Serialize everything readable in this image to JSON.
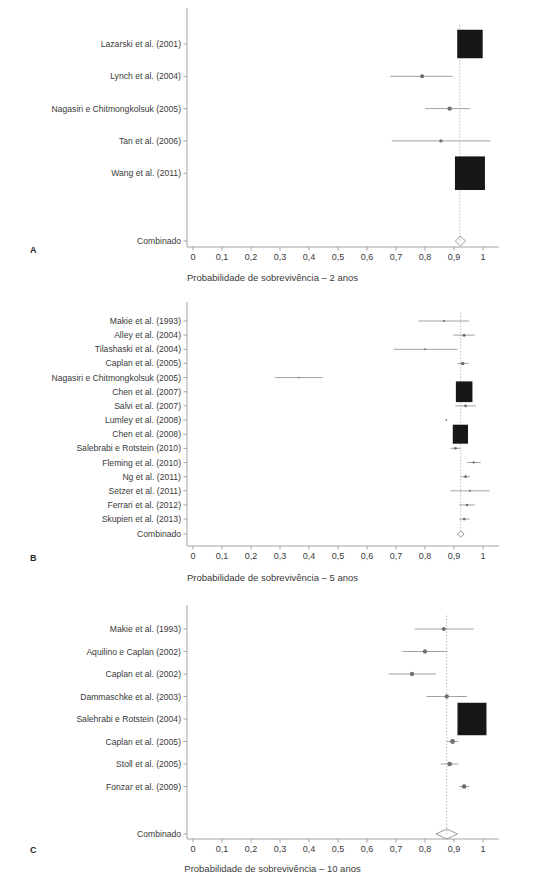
{
  "figure": {
    "panel_letters": [
      "A",
      "B",
      "C"
    ],
    "combined_label": "Combinado",
    "axis_tick_labels": [
      "0",
      "0,1",
      "0,2",
      "0,3",
      "0,4",
      "0,5",
      "0,6",
      "0,7",
      "0,8",
      "0,9",
      "1"
    ],
    "axis_tick_values": [
      0,
      0.1,
      0.2,
      0.3,
      0.4,
      0.5,
      0.6,
      0.7,
      0.8,
      0.9,
      1
    ],
    "colors": {
      "box": "#171717",
      "ci_line": "#8c8c8c",
      "axis": "#9a9a9a",
      "reference_line": "#b0b0b0",
      "text": "#3a3a3a"
    }
  },
  "bottom_caption": "",
  "chart_data": [
    {
      "type": "forest",
      "panel": "A",
      "title": "",
      "xlabel": "Probabilidade de sobrevivência – 2 anos",
      "ylabel": "",
      "xlim": [
        0,
        1.05
      ],
      "grid": false,
      "reference_line": 0.92,
      "studies": [
        {
          "label": "Lazarski et al. (2001)",
          "estimate": 0.955,
          "ci_low": 0.937,
          "ci_high": 0.973,
          "weight": 0.72
        },
        {
          "label": "Lynch et al. (2004)",
          "estimate": 0.79,
          "ci_low": 0.68,
          "ci_high": 0.895,
          "weight": 0.06
        },
        {
          "label": "Nagasiri e Chitmongkolsuk (2005)",
          "estimate": 0.885,
          "ci_low": 0.8,
          "ci_high": 0.955,
          "weight": 0.07
        },
        {
          "label": "Tan et al. (2006)",
          "estimate": 0.855,
          "ci_low": 0.685,
          "ci_high": 1.025,
          "weight": 0.04
        },
        {
          "label": "Wang et al. (2011)",
          "estimate": 0.955,
          "ci_low": 0.925,
          "ci_high": 0.99,
          "weight": 1.0
        }
      ],
      "combined": {
        "label": "Combinado",
        "estimate": 0.922,
        "ci_low": 0.905,
        "ci_high": 0.94
      }
    },
    {
      "type": "forest",
      "panel": "B",
      "title": "",
      "xlabel": "Probabilidade de sobrevivência – 5 anos",
      "ylabel": "",
      "xlim": [
        0,
        1.05
      ],
      "grid": false,
      "reference_line": 0.923,
      "studies": [
        {
          "label": "Makie et al. (1993)",
          "estimate": 0.865,
          "ci_low": 0.777,
          "ci_high": 0.952,
          "weight": 0.05
        },
        {
          "label": "Alley et al. (2004)",
          "estimate": 0.935,
          "ci_low": 0.897,
          "ci_high": 0.972,
          "weight": 0.1
        },
        {
          "label": "Tilashaski et al. (2004)",
          "estimate": 0.8,
          "ci_low": 0.692,
          "ci_high": 0.912,
          "weight": 0.04
        },
        {
          "label": "Caplan et al. (2005)",
          "estimate": 0.93,
          "ci_low": 0.912,
          "ci_high": 0.95,
          "weight": 0.14
        },
        {
          "label": "Nagasiri e Chitmongkolsuk (2005)",
          "estimate": 0.365,
          "ci_low": 0.283,
          "ci_high": 0.447,
          "weight": 0.03
        },
        {
          "label": "Chen et al. (2007)",
          "estimate": 0.935,
          "ci_low": 0.912,
          "ci_high": 0.957,
          "weight": 0.95
        },
        {
          "label": "Salvi et al. (2007)",
          "estimate": 0.94,
          "ci_low": 0.905,
          "ci_high": 0.975,
          "weight": 0.09
        },
        {
          "label": "Lumley et al. (2008)",
          "estimate": 0.873,
          "ci_low": 0.869,
          "ci_high": 0.877,
          "weight": 0.02
        },
        {
          "label": "Chen et al. (2008)",
          "estimate": 0.922,
          "ci_low": 0.905,
          "ci_high": 0.94,
          "weight": 0.8
        },
        {
          "label": "Salebrabi e Rotstein (2010)",
          "estimate": 0.905,
          "ci_low": 0.888,
          "ci_high": 0.923,
          "weight": 0.09
        },
        {
          "label": "Fleming et al. (2010)",
          "estimate": 0.968,
          "ci_low": 0.945,
          "ci_high": 0.992,
          "weight": 0.06
        },
        {
          "label": "Ng et al. (2011)",
          "estimate": 0.94,
          "ci_low": 0.925,
          "ci_high": 0.955,
          "weight": 0.08
        },
        {
          "label": "Setzer et al. (2011)",
          "estimate": 0.955,
          "ci_low": 0.888,
          "ci_high": 1.023,
          "weight": 0.05
        },
        {
          "label": "Ferrari et al. (2012)",
          "estimate": 0.945,
          "ci_low": 0.918,
          "ci_high": 0.972,
          "weight": 0.07
        },
        {
          "label": "Skupien et al. (2013)",
          "estimate": 0.935,
          "ci_low": 0.918,
          "ci_high": 0.953,
          "weight": 0.08
        }
      ],
      "combined": {
        "label": "Combinado",
        "estimate": 0.923,
        "ci_low": 0.912,
        "ci_high": 0.935
      }
    },
    {
      "type": "forest",
      "panel": "C",
      "title": "",
      "xlabel": "Probabilidade de sobrevivência – 10 anos",
      "ylabel": "",
      "xlim": [
        0,
        1.05
      ],
      "grid": false,
      "reference_line": 0.875,
      "studies": [
        {
          "label": "Makie et al. (1993)",
          "estimate": 0.865,
          "ci_low": 0.765,
          "ci_high": 0.968,
          "weight": 0.06
        },
        {
          "label": "Aquilino e Caplan (2002)",
          "estimate": 0.8,
          "ci_low": 0.722,
          "ci_high": 0.877,
          "weight": 0.07
        },
        {
          "label": "Caplan et al. (2002)",
          "estimate": 0.755,
          "ci_low": 0.675,
          "ci_high": 0.838,
          "weight": 0.07
        },
        {
          "label": "Dammaschke et al. (2003)",
          "estimate": 0.875,
          "ci_low": 0.805,
          "ci_high": 0.945,
          "weight": 0.07
        },
        {
          "label": "Salehrabi e Rotstein (2004)",
          "estimate": 0.962,
          "ci_low": 0.945,
          "ci_high": 0.98,
          "weight": 1.0
        },
        {
          "label": "Caplan et al. (2005)",
          "estimate": 0.895,
          "ci_low": 0.875,
          "ci_high": 0.915,
          "weight": 0.09
        },
        {
          "label": "Stoll et al. (2005)",
          "estimate": 0.885,
          "ci_low": 0.855,
          "ci_high": 0.915,
          "weight": 0.08
        },
        {
          "label": "Fonzar et al. (2009)",
          "estimate": 0.935,
          "ci_low": 0.918,
          "ci_high": 0.952,
          "weight": 0.08
        }
      ],
      "combined": {
        "label": "Combinado",
        "estimate": 0.875,
        "ci_low": 0.838,
        "ci_high": 0.912
      }
    }
  ]
}
